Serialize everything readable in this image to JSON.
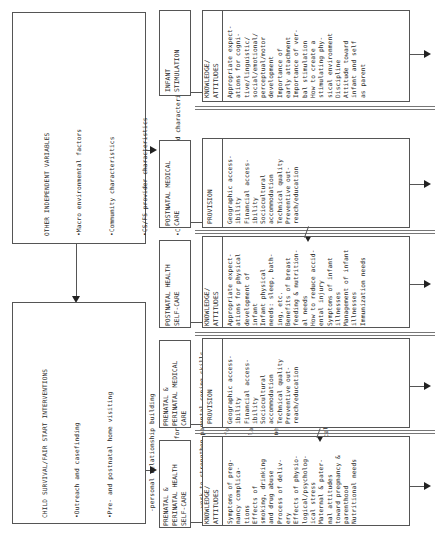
{
  "other_variables": {
    "title": "OTHER INDEPENDENT VARIABLES",
    "items": [
      "Macro environmental factors",
      "Community characteristics",
      "CS/FS provider characteristics",
      "Client & client household characteristics"
    ]
  },
  "interventions": {
    "title": "CHILD SURVIVAL/FAIR START INTERVENTIONS",
    "item1": "Outreach and casefinding",
    "item2": "Pre- and postnatal home visiting",
    "subitems": [
      "-personal relationship building",
      "-sustained support for the mother",
      "-work to strengthen parental coping skills",
      "-parent education/information sharing",
      "-observation/surveillance",
      "-case management as needed"
    ],
    "item3": "Work with local medical care system"
  },
  "columns": [
    {
      "title": "PRENATAL &\nPERINATAL HEALTH\nSELF-CARE",
      "sub_header": "KNOWLEDGE/\nATTITUDES",
      "body": "Symptoms of preg-\nnancy complica-\ntions\nEffects of\nsmoking, drinking\nand drug abuse\nProcess of deliv-\nery\nEffects of physio-\nlogical/psycholog-\nical stress\nMaternal & pater-\nnal attitudes\ntoward pregnancy &\nparenthood\nNutritional needs"
    },
    {
      "title": "PRENATAL &\nPERINATAL MEDICAL\nCARE",
      "sub_header": "PROVISION",
      "body": "Geographic access-\nibility\nFinancial access-\nibility\nSociocultural\naccommodation\nTechnical quality\nPreventive out-\nreach/education"
    },
    {
      "title": "POSTNATAL HEALTH\nSELF-CARE",
      "sub_header": "KNOWLEDGE/\nATTITUDES",
      "body": "Appropriate expect-\nations for physical\ndevelopment of\ninfant\nInfant physical\nneeds: sleep, bath-\ning, etc.\nBenefits of breast\nfeeding & nutrition-\nal needs\nHow to reduce accid-\nental injury\nSymptoms of infant\nillnesses\nManagement of infant\nillnesses\nImmunization needs"
    },
    {
      "title": "POSTNATAL MEDICAL\nCARE",
      "sub_header": "PROVISION",
      "body": "Geographic access-\nibility\nFinancial access-\nibility\nSociocultural\naccommodation\nTechnical quality\nPreventive out-\nreach/education"
    },
    {
      "title": "INFANT\nSTIMULATION",
      "sub_header": "KNOWLEDGE/\nATTITUDES",
      "body": "Appropriate expect-\nations for cogni-\ntive/linguistic/\nsocial/emotional/\nperceptual/motor\ndevelopment\nImportance of\nearly attachment\nImportance of ver-\nbal stimulation\nHow to create a\nstimulating phy-\nsical environment\nDiscipline\nAttitude toward\ninfant and self\nas parent"
    }
  ]
}
